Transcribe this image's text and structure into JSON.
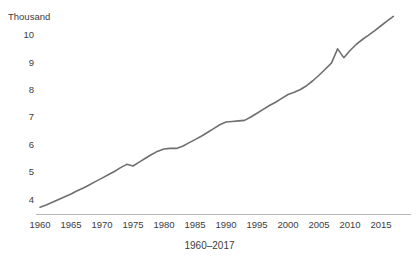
{
  "title_fragment": "",
  "unit_label": "Thousand",
  "axis": {
    "x_caption": "1960–2017",
    "y_ticks": [
      "10",
      "9",
      "8",
      "7",
      "6",
      "5",
      "4"
    ],
    "x_ticks": [
      "1960",
      "1965",
      "1970",
      "1975",
      "1980",
      "1985",
      "1990",
      "1995",
      "2000",
      "2005",
      "2010",
      "2015"
    ]
  },
  "style": {
    "line_color": "#6f6f6f",
    "axis_color": "#b8b8b8",
    "text_color": "#3c3c3c",
    "background": "#ffffff"
  },
  "chart_data": {
    "type": "line",
    "title": "",
    "xlabel": "1960–2017",
    "ylabel": "Thousand",
    "xlim": [
      1960,
      2017
    ],
    "ylim": [
      3.5,
      10.8
    ],
    "grid": false,
    "legend": false,
    "units": "Thousand",
    "x": [
      1960,
      1961,
      1962,
      1963,
      1964,
      1965,
      1966,
      1967,
      1968,
      1969,
      1970,
      1971,
      1972,
      1973,
      1974,
      1975,
      1976,
      1977,
      1978,
      1979,
      1980,
      1981,
      1982,
      1983,
      1984,
      1985,
      1986,
      1987,
      1988,
      1989,
      1990,
      1991,
      1992,
      1993,
      1994,
      1995,
      1996,
      1997,
      1998,
      1999,
      2000,
      2001,
      2002,
      2003,
      2004,
      2005,
      2006,
      2007,
      2008,
      2009,
      2010,
      2011,
      2012,
      2013,
      2014,
      2015,
      2016,
      2017
    ],
    "values": [
      3.7,
      3.78,
      3.88,
      3.98,
      4.08,
      4.18,
      4.3,
      4.4,
      4.52,
      4.64,
      4.76,
      4.88,
      5.0,
      5.14,
      5.26,
      5.2,
      5.34,
      5.48,
      5.62,
      5.74,
      5.82,
      5.84,
      5.84,
      5.92,
      6.04,
      6.16,
      6.28,
      6.42,
      6.56,
      6.7,
      6.8,
      6.82,
      6.84,
      6.86,
      6.98,
      7.12,
      7.26,
      7.4,
      7.52,
      7.66,
      7.8,
      7.88,
      7.98,
      8.12,
      8.3,
      8.5,
      8.72,
      8.94,
      9.46,
      9.14,
      9.4,
      9.62,
      9.8,
      9.96,
      10.12,
      10.3,
      10.48,
      10.64
    ],
    "series": [
      {
        "name": "value",
        "values": [
          3.7,
          3.78,
          3.88,
          3.98,
          4.08,
          4.18,
          4.3,
          4.4,
          4.52,
          4.64,
          4.76,
          4.88,
          5.0,
          5.14,
          5.26,
          5.2,
          5.34,
          5.48,
          5.62,
          5.74,
          5.82,
          5.84,
          5.84,
          5.92,
          6.04,
          6.16,
          6.28,
          6.42,
          6.56,
          6.7,
          6.8,
          6.82,
          6.84,
          6.86,
          6.98,
          7.12,
          7.26,
          7.4,
          7.52,
          7.66,
          7.8,
          7.88,
          7.98,
          8.12,
          8.3,
          8.5,
          8.72,
          8.94,
          9.46,
          9.14,
          9.4,
          9.62,
          9.8,
          9.96,
          10.12,
          10.3,
          10.48,
          10.64
        ]
      }
    ]
  }
}
